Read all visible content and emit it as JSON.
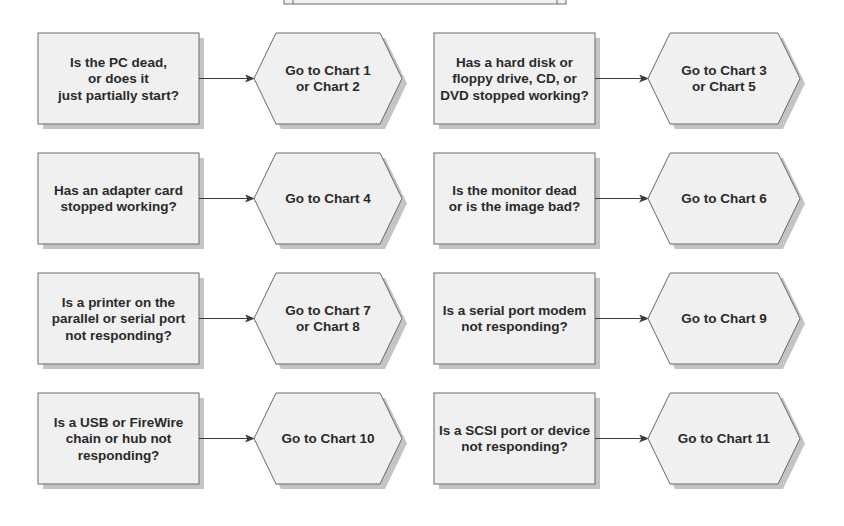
{
  "top_box": {
    "label": ""
  },
  "colors": {
    "shape_fill": "#f0f0f0",
    "shape_stroke": "#6a6a6a",
    "shadow": "#c4c4c4",
    "text": "#2a2a2a",
    "connector": "#3a3a3a"
  },
  "rows": [
    {
      "left": {
        "question": [
          "Is the PC dead,",
          "or does it",
          "just partially start?"
        ],
        "answer": [
          "Go to Chart 1",
          "or Chart 2"
        ]
      },
      "right": {
        "question": [
          "Has a hard disk or",
          "floppy drive, CD, or",
          "DVD stopped working?"
        ],
        "answer": [
          "Go to Chart 3",
          "or Chart 5"
        ]
      }
    },
    {
      "left": {
        "question": [
          "Has an adapter card",
          "stopped working?"
        ],
        "answer": [
          "Go to Chart 4"
        ]
      },
      "right": {
        "question": [
          "Is the monitor dead",
          "or is the image bad?"
        ],
        "answer": [
          "Go to Chart 6"
        ]
      }
    },
    {
      "left": {
        "question": [
          "Is a printer on the",
          "parallel or serial port",
          "not responding?"
        ],
        "answer": [
          "Go to Chart 7",
          "or Chart 8"
        ]
      },
      "right": {
        "question": [
          "Is a serial port modem",
          "not responding?"
        ],
        "answer": [
          "Go to Chart 9"
        ]
      }
    },
    {
      "left": {
        "question": [
          "Is a USB or FireWire",
          "chain or hub not",
          "responding?"
        ],
        "answer": [
          "Go to Chart 10"
        ]
      },
      "right": {
        "question": [
          "Is a SCSI port or device",
          "not responding?"
        ],
        "answer": [
          "Go to Chart 11"
        ]
      }
    }
  ]
}
